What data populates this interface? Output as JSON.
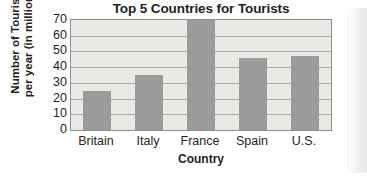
{
  "chart_data": {
    "type": "bar",
    "title": "Top 5 Countries for Tourists",
    "xlabel": "Country",
    "ylabel": "Number of Tourists per year (in millions)",
    "ylabel_lines": [
      "Number of Tourists",
      "per year (in millions)"
    ],
    "categories": [
      "Britain",
      "Italy",
      "France",
      "Spain",
      "U.S."
    ],
    "values": [
      25,
      35,
      70,
      46,
      47
    ],
    "ylim": [
      0,
      70
    ],
    "ytick_labels": [
      "70",
      "60",
      "50",
      "40",
      "30",
      "20",
      "10",
      "0"
    ],
    "ytick_values": [
      70,
      60,
      50,
      40,
      30,
      20,
      10,
      0
    ],
    "ytick_step": 10,
    "grid": true,
    "legend": "none",
    "bar_color": "#9b9b9b",
    "plot_background_color": "#e9e9e6",
    "gridline_color": "#a9a9a6",
    "axis_border_color": "#8f8f8f",
    "text_color": "#231f20"
  }
}
